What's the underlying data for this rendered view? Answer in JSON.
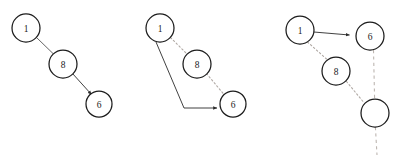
{
  "figure": {
    "background_color": "#ffffff",
    "width": 401,
    "height": 155,
    "node_fill": "#ffffff",
    "node_stroke": "#1c1c1c",
    "solid_edge_color": "#555555",
    "dotted_edge_color": "#b0a9a4",
    "dashed_edge_color": "#bdb6b1"
  },
  "panels": [
    {
      "id": "panel-1",
      "nodes": [
        {
          "id": "p1-n1",
          "label": "1",
          "cx": 26,
          "cy": 28,
          "r": 14
        },
        {
          "id": "p1-n8",
          "label": "8",
          "cx": 63,
          "cy": 64,
          "r": 14
        },
        {
          "id": "p1-n6",
          "label": "6",
          "cx": 99,
          "cy": 104,
          "r": 13
        }
      ],
      "edges": [
        {
          "id": "p1-e1",
          "from": "1",
          "to": "8",
          "style": "solid",
          "arrow": false
        },
        {
          "id": "p1-e2",
          "from": "8",
          "to": "6",
          "style": "solid",
          "arrow": true
        }
      ]
    },
    {
      "id": "panel-2",
      "nodes": [
        {
          "id": "p2-n1",
          "label": "1",
          "cx": 160,
          "cy": 28,
          "r": 14
        },
        {
          "id": "p2-n8",
          "label": "8",
          "cx": 197,
          "cy": 64,
          "r": 14
        },
        {
          "id": "p2-n6",
          "label": "6",
          "cx": 233,
          "cy": 104,
          "r": 13
        }
      ],
      "edges": [
        {
          "id": "p2-e1",
          "from": "1",
          "to": "8",
          "style": "dotted",
          "arrow": false
        },
        {
          "id": "p2-e2",
          "from": "8",
          "to": "6",
          "style": "dotted",
          "arrow": false
        },
        {
          "id": "p2-e3",
          "from": "1",
          "to": "6",
          "style": "solid-elbow",
          "arrow": true
        }
      ]
    },
    {
      "id": "panel-3",
      "nodes": [
        {
          "id": "p3-n1",
          "label": "1",
          "cx": 300,
          "cy": 30,
          "r": 14
        },
        {
          "id": "p3-n6",
          "label": "6",
          "cx": 370,
          "cy": 36,
          "r": 14
        },
        {
          "id": "p3-n8",
          "label": "8",
          "cx": 336,
          "cy": 71,
          "r": 14
        },
        {
          "id": "p3-nblank",
          "label": "",
          "cx": 375,
          "cy": 113,
          "r": 14
        }
      ],
      "edges": [
        {
          "id": "p3-e1",
          "from": "1",
          "to": "6",
          "style": "solid",
          "arrow": true
        },
        {
          "id": "p3-e2",
          "from": "1",
          "to": "8",
          "style": "dotted",
          "arrow": false
        },
        {
          "id": "p3-e3",
          "from": "8",
          "to": "blank",
          "style": "dotted",
          "arrow": false
        },
        {
          "id": "p3-e4",
          "from": "6",
          "to": "blank",
          "style": "dashed",
          "arrow": false
        },
        {
          "id": "p3-e5",
          "from": "blank",
          "to": "below",
          "style": "dashed",
          "arrow": false
        }
      ]
    }
  ]
}
